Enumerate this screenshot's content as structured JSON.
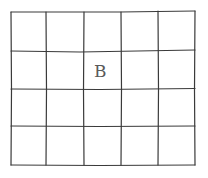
{
  "grid": {
    "rows": 4,
    "columns": 5,
    "line_color": "#3a3a3a",
    "background": "#ffffff",
    "column_lines_x": [
      11,
      46,
      84,
      121,
      158,
      195
    ],
    "row_lines_y": [
      12,
      51,
      89,
      126,
      165
    ]
  },
  "cells": [
    {
      "row": 2,
      "column": 3,
      "label": "B"
    }
  ]
}
